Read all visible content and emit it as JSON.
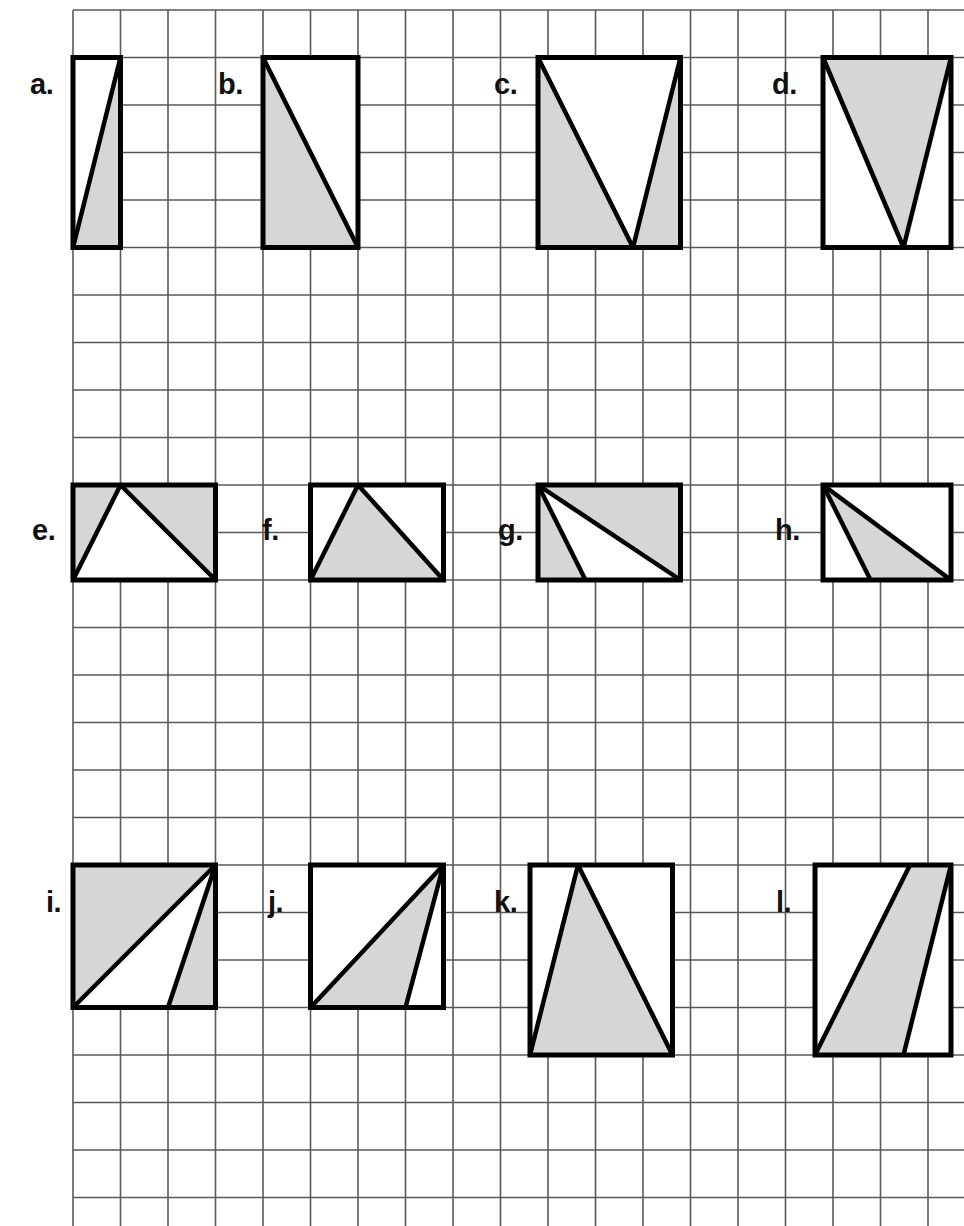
{
  "worksheet": {
    "title": "Shaded Area Triangles on Grid Worksheet",
    "width": 964,
    "height": 1226,
    "background_color": "#ffffff"
  },
  "grid": {
    "origin_x": 73,
    "origin_y": 10,
    "cell_size": 47.5,
    "columns": 19,
    "rows": 26,
    "line_color": "#58595b",
    "line_width": 1.6,
    "visible": true
  },
  "style": {
    "outline_color": "#000000",
    "outline_width": 5,
    "shaded_fill": "#d6d6d6",
    "unshaded_fill": "#ffffff",
    "label_color": "#111111",
    "label_font_size": "29px"
  },
  "figures": [
    {
      "id": "a",
      "label": "a.",
      "label_x": 30,
      "label_y": 70,
      "rect_cols": [
        0,
        1
      ],
      "rect_rows": [
        1,
        5
      ],
      "box": {
        "x": 73,
        "y": 57.5,
        "w": 47.5,
        "h": 190
      },
      "shaded_polygon": "73,247.5 120.5,247.5 120.5,57.5",
      "internal_lines": [
        "73,247.5 120.5,57.5"
      ],
      "description": "Tall narrow rectangle 1 wide by 4 tall; shaded right triangle with vertical right leg."
    },
    {
      "id": "b",
      "label": "b.",
      "label_x": 218,
      "label_y": 70,
      "rect_cols": [
        4,
        6
      ],
      "rect_rows": [
        1,
        5
      ],
      "box": {
        "x": 263,
        "y": 57.5,
        "w": 95,
        "h": 190
      },
      "shaded_polygon": "263,57.5 263,247.5 358,247.5",
      "internal_lines": [
        "263,57.5 358,247.5"
      ],
      "description": "Rectangle 2 wide by 4 tall; shaded right triangle with vertical left leg and bottom leg."
    },
    {
      "id": "c",
      "label": "c.",
      "label_x": 494,
      "label_y": 70,
      "rect_cols": [
        10,
        13
      ],
      "rect_rows": [
        1,
        5
      ],
      "box": {
        "x": 538,
        "y": 57.5,
        "w": 142.5,
        "h": 190
      },
      "shaded_polygon": "538,57.5 538,247.5 680.5,247.5 680.5,57.5",
      "unshaded_polygon": "538,57.5 680.5,57.5 633,247.5",
      "internal_lines": [
        "538,57.5 633,247.5",
        "633,247.5 680.5,57.5"
      ],
      "description": "Rectangle 3 wide by 4 tall; unshaded downward-pointing triangle, shaded corners left and right."
    },
    {
      "id": "d",
      "label": "d.",
      "label_x": 772,
      "label_y": 70,
      "rect_cols": [
        16,
        19
      ],
      "rect_rows": [
        1,
        5
      ],
      "box": {
        "x": 823,
        "y": 57.5,
        "w": 128,
        "h": 190
      },
      "shaded_polygon": "823,57.5 951,57.5 903.5,247.5",
      "internal_lines": [
        "823,57.5 903.5,247.5",
        "903.5,247.5 951,57.5"
      ],
      "description": "Rectangle 3 wide by 4 tall; shaded downward-pointing triangle spanning the top edge."
    },
    {
      "id": "e",
      "label": "e.",
      "label_x": 32,
      "label_y": 516,
      "rect_cols": [
        0,
        3
      ],
      "rect_rows": [
        10,
        12
      ],
      "box": {
        "x": 73,
        "y": 485,
        "w": 142.5,
        "h": 95
      },
      "shaded_polygon": "73,485 215.5,485 215.5,580 73,580",
      "unshaded_polygon": "73,580 120.5,485 215.5,580",
      "internal_lines": [
        "73,580 120.5,485",
        "120.5,485 215.5,580"
      ],
      "description": "Rectangle 3 wide by 2 tall; unshaded triangle with apex on top edge, shaded corners."
    },
    {
      "id": "f",
      "label": "f.",
      "label_x": 262,
      "label_y": 516,
      "rect_cols": [
        5,
        8
      ],
      "rect_rows": [
        10,
        12
      ],
      "box": {
        "x": 310.5,
        "y": 485,
        "w": 133,
        "h": 95
      },
      "shaded_polygon": "310.5,580 358,485 443.5,580",
      "internal_lines": [
        "310.5,580 358,485",
        "358,485 443.5,580"
      ],
      "description": "Rectangle 3 wide by 2 tall; shaded triangle with apex on top edge and base along bottom."
    },
    {
      "id": "g",
      "label": "g.",
      "label_x": 498,
      "label_y": 516,
      "rect_cols": [
        10,
        13
      ],
      "rect_rows": [
        10,
        12
      ],
      "box": {
        "x": 538,
        "y": 485,
        "w": 142.5,
        "h": 95
      },
      "shaded_polygon": "538,485 680.5,485 680.5,580 585.5,580 538,580",
      "unshaded_polygon": "538,485 585.5,580 680.5,580",
      "internal_lines": [
        "538,485 585.5,580",
        "538,485 680.5,580"
      ],
      "description": "Rectangle 3 wide by 2 tall; unshaded triangle from top-left to bottom edge, shaded sliver left and upper-right region."
    },
    {
      "id": "h",
      "label": "h.",
      "label_x": 775,
      "label_y": 516,
      "rect_cols": [
        15,
        18
      ],
      "rect_rows": [
        10,
        12
      ],
      "box": {
        "x": 823,
        "y": 485,
        "w": 128,
        "h": 95
      },
      "shaded_polygon": "823,485 951,580 870.5,580",
      "internal_lines": [
        "823,485 870.5,580",
        "823,485 951,580"
      ],
      "description": "Rectangle 3 wide by 2 tall; thin shaded triangle from top-left corner to bottom-right corner."
    },
    {
      "id": "i",
      "label": "i.",
      "label_x": 46,
      "label_y": 888,
      "rect_cols": [
        0,
        3
      ],
      "rect_rows": [
        18,
        21
      ],
      "box": {
        "x": 73,
        "y": 865,
        "w": 142.5,
        "h": 142.5
      },
      "shaded_polygon": "73,865 215.5,865 215.5,1007.5 168,1007.5 73,1007.5",
      "unshaded_polygon": "73,1007.5 215.5,865 168,1007.5",
      "internal_lines": [
        "73,1007.5 215.5,865",
        "168,1007.5 215.5,865"
      ],
      "description": "Square 3 by 3; shaded upper-left triangle plus small shaded triangle at bottom-right."
    },
    {
      "id": "j",
      "label": "j.",
      "label_x": 268,
      "label_y": 888,
      "rect_cols": [
        5,
        8
      ],
      "rect_rows": [
        18,
        21
      ],
      "box": {
        "x": 310.5,
        "y": 865,
        "w": 133,
        "h": 142.5
      },
      "shaded_polygon": "310.5,1007.5 443.5,865 405.5,1007.5",
      "internal_lines": [
        "310.5,1007.5 443.5,865",
        "443.5,865 405.5,1007.5"
      ],
      "description": "Square 3 by 3; shaded triangle from bottom-left corner to top-right corner."
    },
    {
      "id": "k",
      "label": "k.",
      "label_x": 494,
      "label_y": 888,
      "rect_cols": [
        10,
        13
      ],
      "rect_rows": [
        18,
        22
      ],
      "box": {
        "x": 530,
        "y": 865,
        "w": 142.5,
        "h": 190
      },
      "shaded_polygon": "530,1055 578,865 672.5,1055",
      "internal_lines": [
        "530,1055 578,865",
        "578,865 672.5,1055"
      ],
      "description": "Rectangle 3 wide by 4 tall; shaded triangle with apex on top edge and base along bottom edge."
    },
    {
      "id": "l",
      "label": "l.",
      "label_x": 776,
      "label_y": 888,
      "rect_cols": [
        16,
        19
      ],
      "rect_rows": [
        18,
        22
      ],
      "box": {
        "x": 815,
        "y": 865,
        "w": 136,
        "h": 190
      },
      "shaded_polygon": "815,1055 910,865 951,865 903.5,1055",
      "internal_lines": [
        "815,1055 910,865",
        "951,865 903.5,1055"
      ],
      "description": "Rectangle 3 wide by 4 tall; shaded slanted quadrilateral (parallelogram-like band)."
    }
  ]
}
